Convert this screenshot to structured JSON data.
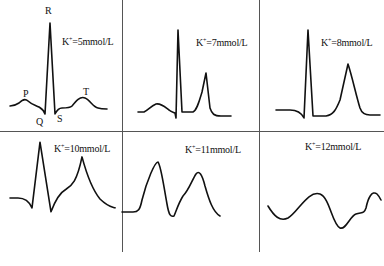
{
  "figure": {
    "panels": [
      {
        "id": "k5",
        "prefix": "K",
        "sup": "+",
        "value": "=5mmol/L"
      },
      {
        "id": "k7",
        "prefix": "K",
        "sup": "+",
        "value": "=7mmol/L"
      },
      {
        "id": "k8",
        "prefix": "K",
        "sup": "+",
        "value": "=8mmol/L"
      },
      {
        "id": "k10",
        "prefix": "K",
        "sup": "+",
        "value": "=10mmol/L"
      },
      {
        "id": "k11",
        "prefix": "K",
        "sup": "+",
        "value": "=11mmol/L"
      },
      {
        "id": "k12",
        "prefix": "K",
        "sup": "+",
        "value": "=12mmol/L"
      }
    ],
    "wave_labels": {
      "p": "P",
      "q": "Q",
      "r": "R",
      "s": "S",
      "t": "T"
    },
    "stroke_color": "#111111",
    "divider_color": "#555555"
  }
}
